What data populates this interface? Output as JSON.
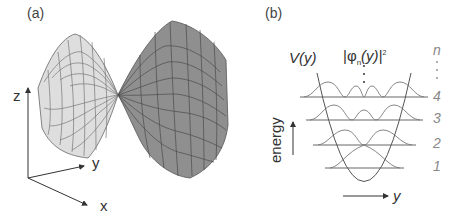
{
  "panels": {
    "a": {
      "label": "(a)",
      "title": "saddle surface",
      "axes": {
        "x": "x",
        "y": "y",
        "z": "z"
      },
      "colors": {
        "left_lobe": "#dcdcdc",
        "right_lobe": "#8c8c8c",
        "mesh": "#555555"
      }
    },
    "b": {
      "label": "(b)",
      "potential_label": "V(y)",
      "wavefunction_label": "|φn(y)|²",
      "wavefunction_base": "|φ",
      "wavefunction_sub": "n",
      "wavefunction_rest": "(y)|",
      "wavefunction_sup": "2",
      "quantum_number_label": "n",
      "levels": [
        "1",
        "2",
        "3",
        "4"
      ],
      "energy_label": "energy",
      "y_axis_label": "y",
      "colors": {
        "curve": "#555555",
        "level_line": "#666666",
        "level_number": "#888888"
      }
    }
  }
}
